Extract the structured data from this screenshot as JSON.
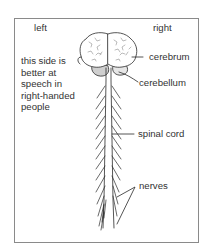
{
  "diagram": {
    "type": "anatomical-labelled-diagram",
    "side_labels": {
      "left": "left",
      "right": "right"
    },
    "annotation": "this side is\nbetter at\nspeech in\nright-handed\npeople",
    "parts": [
      {
        "id": "cerebrum",
        "label": "cerebrum"
      },
      {
        "id": "cerebellum",
        "label": "cerebellum"
      },
      {
        "id": "spinal-cord",
        "label": "spinal cord"
      },
      {
        "id": "nerves",
        "label": "nerves"
      }
    ],
    "colors": {
      "line": "#2a2a2a",
      "frame": "#8a8a8a",
      "cerebellum_fill": "#cfcfcf",
      "background": "#ffffff"
    }
  }
}
